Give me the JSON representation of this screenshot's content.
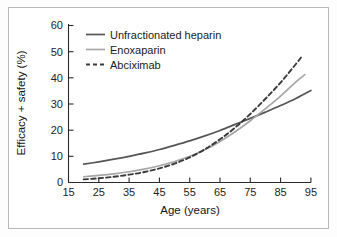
{
  "figure": {
    "background_color": "#ffffff",
    "frame_color": "#b9b9b9"
  },
  "chart_data": {
    "type": "line",
    "title": "",
    "xlabel": "Age (years)",
    "ylabel": "Efficacy + safety (%)",
    "xlim": [
      15,
      95
    ],
    "ylim": [
      0,
      60
    ],
    "xticks": [
      15,
      25,
      35,
      45,
      55,
      65,
      75,
      85,
      95
    ],
    "yticks": [
      0,
      10,
      20,
      30,
      40,
      50,
      60
    ],
    "grid": false,
    "legend_position": "upper-left-inside",
    "series": [
      {
        "name": "Unfractionated heparin",
        "color": "#555555",
        "style": "solid",
        "x": [
          20,
          25,
          30,
          35,
          40,
          45,
          50,
          55,
          60,
          65,
          70,
          75,
          80,
          85,
          90,
          95
        ],
        "values": [
          7.0,
          7.9,
          8.9,
          10.0,
          11.2,
          12.6,
          14.2,
          15.9,
          17.8,
          19.9,
          22.2,
          24.5,
          26.9,
          29.4,
          32.1,
          35.2
        ]
      },
      {
        "name": "Enoxaparin",
        "color": "#a6a6a6",
        "style": "solid",
        "x": [
          20,
          25,
          30,
          35,
          40,
          45,
          50,
          55,
          60,
          65,
          70,
          75,
          80,
          85,
          90,
          93
        ],
        "values": [
          2.2,
          2.7,
          3.3,
          4.1,
          5.1,
          6.4,
          8.0,
          10.0,
          12.5,
          15.7,
          19.4,
          23.6,
          28.2,
          33.0,
          38.4,
          41.2
        ]
      },
      {
        "name": "Abciximab",
        "color": "#3a3a3a",
        "style": "dashed",
        "x": [
          20,
          25,
          30,
          35,
          40,
          45,
          50,
          55,
          60,
          65,
          70,
          75,
          80,
          85,
          90,
          92
        ],
        "values": [
          1.2,
          1.6,
          2.2,
          3.0,
          4.0,
          5.4,
          7.2,
          9.6,
          12.7,
          16.5,
          21.0,
          26.2,
          32.0,
          38.2,
          45.2,
          48.2
        ]
      }
    ]
  },
  "legend": {
    "items": [
      {
        "label": "Unfractionated heparin"
      },
      {
        "label": "Enoxaparin"
      },
      {
        "label": "Abciximab"
      }
    ]
  },
  "axes": {
    "x_tick_labels": [
      "15",
      "25",
      "35",
      "45",
      "55",
      "65",
      "75",
      "85",
      "95"
    ],
    "y_tick_labels": [
      "0",
      "10",
      "20",
      "30",
      "40",
      "50",
      "60"
    ],
    "x_title": "Age (years)",
    "y_title": "Efficacy + safety (%)"
  }
}
